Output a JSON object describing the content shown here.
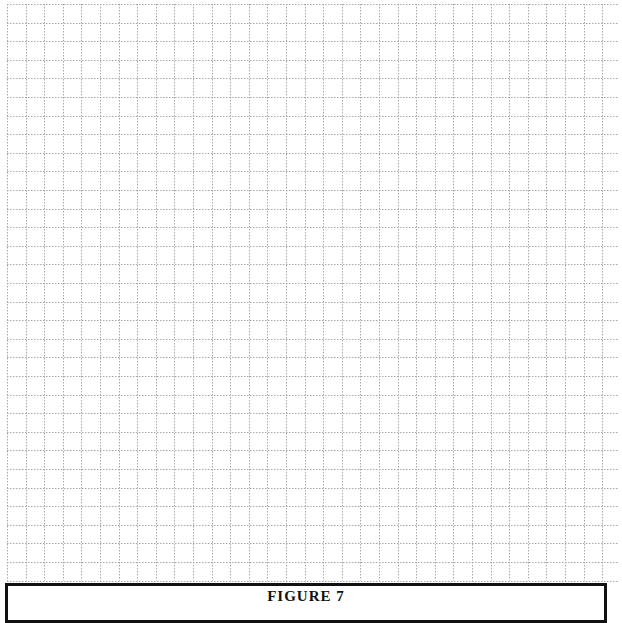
{
  "figure": {
    "title": "FIGURE 7"
  },
  "grid": {
    "spacing_px": 18.6,
    "columns": 33,
    "rows": 31,
    "line_color": "#a8a8a8",
    "line_style": "dotted"
  }
}
